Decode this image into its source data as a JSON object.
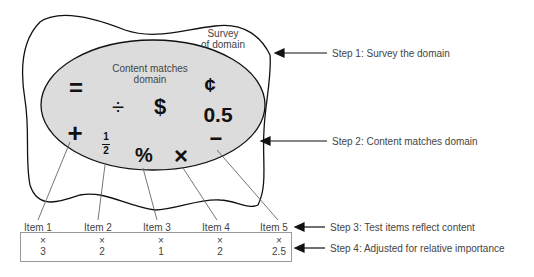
{
  "diagram": {
    "outer_region_label": [
      "Survey",
      "of domain"
    ],
    "inner_region_label": [
      "Content matches",
      "domain"
    ],
    "symbols": [
      {
        "glyph": "=",
        "name": "equals"
      },
      {
        "glyph": "÷",
        "name": "divide"
      },
      {
        "glyph": "$",
        "name": "dollar"
      },
      {
        "glyph": "¢",
        "name": "cent"
      },
      {
        "glyph": "0.5",
        "name": "decimal"
      },
      {
        "glyph": "+",
        "name": "plus"
      },
      {
        "glyph": "1",
        "name": "fraction-numerator"
      },
      {
        "glyph": "2",
        "name": "fraction-denominator"
      },
      {
        "glyph": "%",
        "name": "percent"
      },
      {
        "glyph": "×",
        "name": "times"
      },
      {
        "glyph": "−",
        "name": "minus"
      }
    ],
    "items": [
      {
        "label": "Item 1",
        "multiplier": "×",
        "weight": "3"
      },
      {
        "label": "Item 2",
        "multiplier": "×",
        "weight": "2"
      },
      {
        "label": "Item 3",
        "multiplier": "×",
        "weight": "1"
      },
      {
        "label": "Item 4",
        "multiplier": "×",
        "weight": "2"
      },
      {
        "label": "Item 5",
        "multiplier": "×",
        "weight": "2.5"
      }
    ],
    "steps": [
      "Step 1: Survey the domain",
      "Step 2: Content matches domain",
      "Step 3: Test items reflect content",
      "Step 4:  Adjusted for relative importance"
    ],
    "colors": {
      "ellipse_fill": "#dcdcdc",
      "outline": "#111111",
      "leader_lines": "#666666",
      "text": "#444444"
    }
  }
}
